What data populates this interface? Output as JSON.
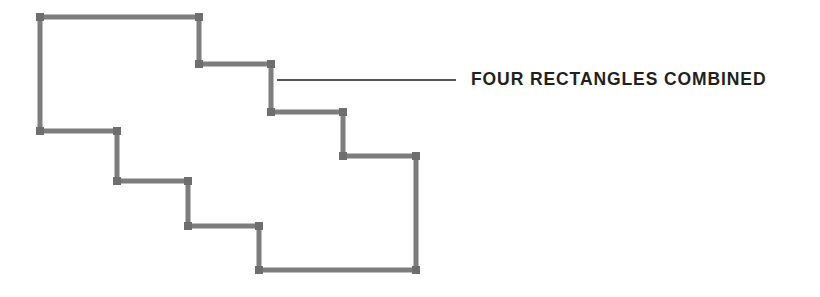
{
  "figure": {
    "title": "Four Rectangles Combined",
    "background_color": "#ffffff",
    "stroke_color": "#7d7d7d",
    "stroke_width": 5,
    "vertex_marker_color": "#6e6e6e",
    "vertex_marker_size": 8,
    "leader_line_color": "#231f20",
    "leader_line_width": 1.4,
    "polygon_points": "40,17 199,17 199,64 271,64 271,112 343,112 343,156 416,156 416,270 259,270 259,226 188,226 188,181 117,181 117,131 40,131",
    "vertices": [
      {
        "x": 40,
        "y": 17
      },
      {
        "x": 199,
        "y": 17
      },
      {
        "x": 199,
        "y": 64
      },
      {
        "x": 271,
        "y": 64
      },
      {
        "x": 271,
        "y": 112
      },
      {
        "x": 343,
        "y": 112
      },
      {
        "x": 343,
        "y": 156
      },
      {
        "x": 416,
        "y": 156
      },
      {
        "x": 416,
        "y": 270
      },
      {
        "x": 259,
        "y": 270
      },
      {
        "x": 259,
        "y": 226
      },
      {
        "x": 188,
        "y": 226
      },
      {
        "x": 188,
        "y": 181
      },
      {
        "x": 117,
        "y": 181
      },
      {
        "x": 117,
        "y": 131
      },
      {
        "x": 40,
        "y": 131
      }
    ],
    "leader_line": {
      "x1": 277,
      "y1": 80,
      "x2": 456,
      "y2": 80
    }
  },
  "callout": {
    "label": "FOUR RECTANGLES COMBINED"
  }
}
